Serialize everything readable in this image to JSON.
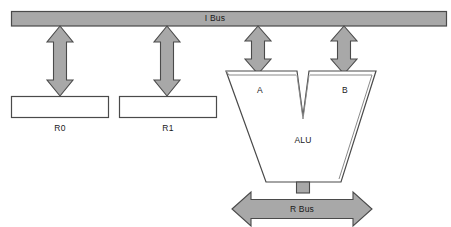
{
  "diagram": {
    "type": "block-diagram",
    "colors": {
      "bus_fill": "#a8a8a8",
      "arrow_fill": "#a8a8a8",
      "stroke": "#4a4a4a",
      "box_fill": "#ffffff",
      "text": "#1a1a1a",
      "background": "#ffffff"
    },
    "buses": [
      {
        "name": "i-bus",
        "label": "I Bus",
        "orientation": "horizontal",
        "label_x": 215,
        "label_y": 18
      },
      {
        "name": "r-bus",
        "label": "R Bus",
        "orientation": "horizontal",
        "double_headed": true,
        "label_x": 302,
        "label_y": 209
      }
    ],
    "registers": [
      {
        "name": "r0",
        "label": "R0",
        "label_x": 60,
        "label_y": 128
      },
      {
        "name": "r1",
        "label": "R1",
        "label_x": 168,
        "label_y": 128
      }
    ],
    "alu": {
      "label": "ALU",
      "label_x": 303,
      "label_y": 140,
      "inputs": [
        {
          "name": "a",
          "label": "A",
          "label_x": 260,
          "label_y": 90
        },
        {
          "name": "b",
          "label": "B",
          "label_x": 345,
          "label_y": 90
        }
      ]
    },
    "connections": [
      {
        "name": "i-bus-to-r0",
        "style": "double-headed-vertical-arrow"
      },
      {
        "name": "i-bus-to-r1",
        "style": "double-headed-vertical-arrow"
      },
      {
        "name": "i-bus-to-alu-a",
        "style": "double-headed-vertical-arrow"
      },
      {
        "name": "i-bus-to-alu-b",
        "style": "double-headed-vertical-arrow"
      },
      {
        "name": "alu-to-r-bus",
        "style": "stem"
      }
    ]
  }
}
